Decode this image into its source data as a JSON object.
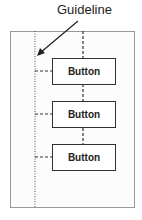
{
  "callout": {
    "label": "Guideline"
  },
  "buttons": [
    {
      "label": "Button"
    },
    {
      "label": "Button"
    },
    {
      "label": "Button"
    }
  ],
  "colors": {
    "line": "#333333",
    "frame": "#999999"
  }
}
